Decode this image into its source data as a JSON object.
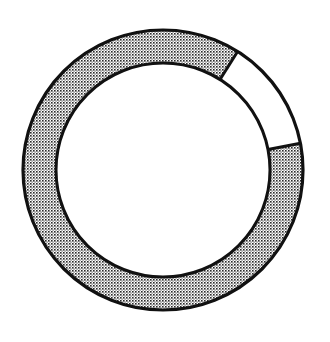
{
  "chart_data": {
    "type": "pie",
    "variant": "donut",
    "title": "",
    "start_angle_deg_from_north": 79,
    "direction": "clockwise",
    "segments": [
      {
        "label": "shaded",
        "value": 87,
        "fill": "stipple",
        "color": "#8c8c8c"
      },
      {
        "label": "unshaded",
        "value": 13,
        "fill": "solid",
        "color": "#ffffff"
      }
    ],
    "stroke_color": "#111111",
    "legend": "none",
    "data_labels": []
  }
}
